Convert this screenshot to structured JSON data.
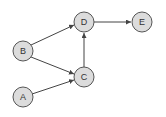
{
  "diagram": {
    "type": "directed-graph",
    "nodes": [
      {
        "id": "A",
        "label": "A",
        "x": 23,
        "y": 97
      },
      {
        "id": "B",
        "label": "B",
        "x": 23,
        "y": 51
      },
      {
        "id": "C",
        "label": "C",
        "x": 84,
        "y": 77
      },
      {
        "id": "D",
        "label": "D",
        "x": 84,
        "y": 22
      },
      {
        "id": "E",
        "label": "E",
        "x": 142,
        "y": 22
      }
    ],
    "edges": [
      {
        "from": "A",
        "to": "C"
      },
      {
        "from": "B",
        "to": "C"
      },
      {
        "from": "B",
        "to": "D"
      },
      {
        "from": "C",
        "to": "D"
      },
      {
        "from": "D",
        "to": "E"
      }
    ],
    "colors": {
      "node_fill": "#dcdcdc",
      "node_stroke": "#555555",
      "edge": "#444444",
      "label": "#333333"
    }
  }
}
